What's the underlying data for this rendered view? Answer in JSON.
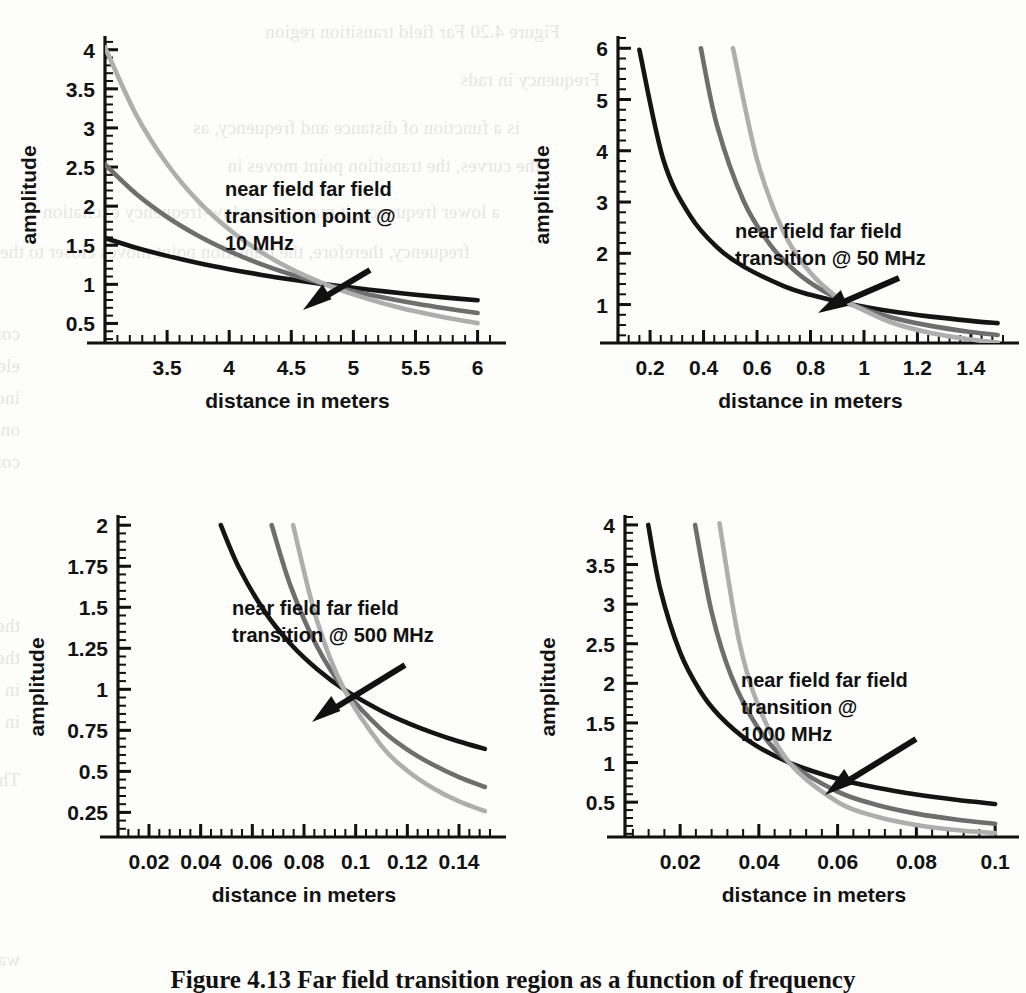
{
  "figure": {
    "caption": "Figure 4.13  Far field transition region as a function of frequency",
    "axis_labels": {
      "x": "distance in meters",
      "y": "amplitude"
    },
    "colors": {
      "curve_1_over_r": "#141414",
      "curve_1_over_r2": "#6e6e6e",
      "curve_1_over_r3": "#aeaeae",
      "axis": "#111111",
      "page_background": "#fdfdfb",
      "text": "#111111"
    }
  },
  "chart_data": [
    {
      "type": "line",
      "title": "near field far field transition point @ 10 MHz",
      "annotation": [
        "near field far field",
        "transition point @",
        "10 MHz"
      ],
      "frequency_mhz": 10,
      "xlabel": "distance in meters",
      "ylabel": "amplitude",
      "xlim": [
        3.0,
        6.1
      ],
      "ylim": [
        0.25,
        4.15
      ],
      "xticks": [
        3.5,
        4,
        4.5,
        5,
        5.5,
        6
      ],
      "xtick_labels": [
        "3.5",
        "4",
        "4.5",
        "5",
        "5.5",
        "6"
      ],
      "yticks": [
        0.5,
        1,
        1.5,
        2,
        2.5,
        3,
        3.5,
        4
      ],
      "ytick_labels": [
        "0.5",
        "1",
        "1.5",
        "2",
        "2.5",
        "3",
        "3.5",
        "4"
      ],
      "grid": false,
      "legend": "none",
      "transition_point": {
        "x": 4.775,
        "y": 1.0
      },
      "series": [
        {
          "name": "1/r",
          "color": "#141414",
          "x": [
            3.0,
            3.25,
            3.5,
            3.75,
            4.0,
            4.25,
            4.5,
            4.775,
            5.0,
            5.25,
            5.5,
            5.75,
            6.0
          ],
          "y": [
            1.592,
            1.469,
            1.364,
            1.273,
            1.194,
            1.124,
            1.061,
            1.0,
            0.955,
            0.91,
            0.868,
            0.83,
            0.796
          ]
        },
        {
          "name": "1/r^2",
          "color": "#6e6e6e",
          "x": [
            3.0,
            3.25,
            3.5,
            3.75,
            4.0,
            4.25,
            4.5,
            4.775,
            5.0,
            5.25,
            5.5,
            5.75,
            6.0
          ],
          "y": [
            2.533,
            2.158,
            1.861,
            1.621,
            1.425,
            1.262,
            1.126,
            1.0,
            0.912,
            0.828,
            0.754,
            0.69,
            0.633
          ]
        },
        {
          "name": "1/r^3",
          "color": "#aeaeae",
          "x": [
            3.0,
            3.25,
            3.5,
            3.75,
            4.0,
            4.25,
            4.5,
            4.775,
            5.0,
            5.25,
            5.5,
            5.75,
            6.0
          ],
          "y": [
            4.031,
            3.171,
            2.539,
            2.064,
            1.701,
            1.419,
            1.195,
            1.0,
            0.871,
            0.753,
            0.655,
            0.572,
            0.504
          ]
        }
      ]
    },
    {
      "type": "line",
      "title": "near field far field transition @ 50 MHz",
      "annotation": [
        "near field far field",
        "transition @ 50 MHz"
      ],
      "frequency_mhz": 50,
      "xlabel": "distance in meters",
      "ylabel": "amplitude",
      "xlim": [
        0.08,
        1.52
      ],
      "ylim": [
        0.25,
        6.2
      ],
      "xticks": [
        0.2,
        0.4,
        0.6,
        0.8,
        1.0,
        1.2,
        1.4
      ],
      "xtick_labels": [
        "0.2",
        "0.4",
        "0.6",
        "0.8",
        "1",
        "1.2",
        "1.4"
      ],
      "yticks": [
        1,
        2,
        3,
        4,
        5,
        6
      ],
      "ytick_labels": [
        "1",
        "2",
        "3",
        "4",
        "5",
        "6"
      ],
      "grid": false,
      "legend": "none",
      "transition_point": {
        "x": 0.955,
        "y": 1.0
      },
      "series": [
        {
          "name": "1/r",
          "color": "#141414",
          "x": [
            0.16,
            0.25,
            0.35,
            0.45,
            0.55,
            0.7,
            0.8,
            0.955,
            1.1,
            1.25,
            1.4,
            1.5
          ],
          "y": [
            5.97,
            3.82,
            2.73,
            2.12,
            1.74,
            1.36,
            1.19,
            1.0,
            0.868,
            0.764,
            0.682,
            0.637
          ]
        },
        {
          "name": "1/r^2",
          "color": "#6e6e6e",
          "x": [
            0.39,
            0.45,
            0.55,
            0.65,
            0.75,
            0.85,
            0.955,
            1.1,
            1.25,
            1.4,
            1.5
          ],
          "y": [
            6.0,
            4.5,
            3.02,
            2.16,
            1.62,
            1.26,
            1.0,
            0.754,
            0.584,
            0.465,
            0.405
          ]
        },
        {
          "name": "1/r^3",
          "color": "#aeaeae",
          "x": [
            0.51,
            0.6,
            0.7,
            0.8,
            0.9,
            0.955,
            1.1,
            1.25,
            1.4,
            1.5
          ],
          "y": [
            6.0,
            3.83,
            2.41,
            1.62,
            1.14,
            1.0,
            0.655,
            0.446,
            0.317,
            0.258
          ]
        }
      ]
    },
    {
      "type": "line",
      "title": "near field far field transition @ 500 MHz",
      "annotation": [
        "near field far field",
        "transition @ 500 MHz"
      ],
      "frequency_mhz": 500,
      "xlabel": "distance in meters",
      "ylabel": "amplitude",
      "xlim": [
        0.008,
        0.152
      ],
      "ylim": [
        0.1,
        2.05
      ],
      "xticks": [
        0.02,
        0.04,
        0.06,
        0.08,
        0.1,
        0.12,
        0.14
      ],
      "xtick_labels": [
        "0.02",
        "0.04",
        "0.06",
        "0.08",
        "0.1",
        "0.12",
        "0.14"
      ],
      "yticks": [
        0.25,
        0.5,
        0.75,
        1,
        1.25,
        1.5,
        1.75,
        2
      ],
      "ytick_labels": [
        "0.25",
        "0.5",
        "0.75",
        "1",
        "1.25",
        "1.5",
        "1.75",
        "2"
      ],
      "grid": false,
      "legend": "none",
      "transition_point": {
        "x": 0.0955,
        "y": 1.0
      },
      "series": [
        {
          "name": "1/r",
          "color": "#141414",
          "x": [
            0.0478,
            0.055,
            0.065,
            0.075,
            0.085,
            0.0955,
            0.11,
            0.12,
            0.13,
            0.14,
            0.15
          ],
          "y": [
            2.0,
            1.736,
            1.469,
            1.273,
            1.124,
            1.0,
            0.868,
            0.796,
            0.735,
            0.682,
            0.637
          ]
        },
        {
          "name": "1/r^2",
          "color": "#6e6e6e",
          "x": [
            0.0675,
            0.075,
            0.085,
            0.0955,
            0.11,
            0.12,
            0.13,
            0.14,
            0.15
          ],
          "y": [
            2.0,
            1.621,
            1.262,
            1.0,
            0.754,
            0.633,
            0.54,
            0.465,
            0.405
          ]
        },
        {
          "name": "1/r^3",
          "color": "#aeaeae",
          "x": [
            0.0758,
            0.085,
            0.0955,
            0.11,
            0.12,
            0.13,
            0.14,
            0.15
          ],
          "y": [
            2.0,
            1.419,
            1.0,
            0.655,
            0.504,
            0.397,
            0.317,
            0.258
          ]
        }
      ]
    },
    {
      "type": "line",
      "title": "near field far field transition @ 1000 MHz",
      "annotation": [
        "near field far field",
        "transition @",
        "1000 MHz"
      ],
      "frequency_mhz": 1000,
      "xlabel": "distance in meters",
      "ylabel": "amplitude",
      "xlim": [
        0.006,
        0.102
      ],
      "ylim": [
        0.06,
        4.1
      ],
      "xticks": [
        0.02,
        0.04,
        0.06,
        0.08,
        0.1
      ],
      "xtick_labels": [
        "0.02",
        "0.04",
        "0.06",
        "0.08",
        "0.1"
      ],
      "yticks": [
        0.5,
        1,
        1.5,
        2,
        2.5,
        3,
        3.5,
        4
      ],
      "ytick_labels": [
        "0.5",
        "1",
        "1.5",
        "2",
        "2.5",
        "3",
        "3.5",
        "4"
      ],
      "grid": false,
      "legend": "none",
      "transition_point": {
        "x": 0.0477,
        "y": 1.0
      },
      "series": [
        {
          "name": "1/r",
          "color": "#141414",
          "x": [
            0.0119,
            0.015,
            0.02,
            0.025,
            0.03,
            0.0375,
            0.0477,
            0.06,
            0.07,
            0.08,
            0.09,
            0.1
          ],
          "y": [
            4.0,
            3.18,
            2.39,
            1.91,
            1.59,
            1.27,
            1.0,
            0.795,
            0.681,
            0.596,
            0.53,
            0.477
          ]
        },
        {
          "name": "1/r^2",
          "color": "#6e6e6e",
          "x": [
            0.0238,
            0.028,
            0.033,
            0.04,
            0.0477,
            0.06,
            0.07,
            0.08,
            0.09,
            0.1
          ],
          "y": [
            4.0,
            2.9,
            2.09,
            1.42,
            1.0,
            0.632,
            0.464,
            0.355,
            0.281,
            0.228
          ]
        },
        {
          "name": "1/r^3",
          "color": "#aeaeae",
          "x": [
            0.03,
            0.035,
            0.04,
            0.0477,
            0.06,
            0.07,
            0.08,
            0.09,
            0.1
          ],
          "y": [
            4.02,
            2.53,
            1.7,
            1.0,
            0.502,
            0.316,
            0.212,
            0.149,
            0.109
          ]
        }
      ]
    }
  ],
  "bleed_text": {
    "lines": [
      "Figure 4.20 Far field transition region",
      "Frequency in rads",
      "is a function of distance and frequency, as",
      "the curves, the transition point moves in",
      "a lower frequency, it may cross a low-frequency excitation",
      "frequency, therefore, the transition point moves closer to the antenna",
      "concerned with the transition point will become clear as we develop expressions for the",
      "electric and magnetic fields. As before, we derive propagating wavefields in Chapters 7 and 8",
      "indicate that at frequencies of interest, ICs, packages, and other PCB features are",
      "on the order of mm, dipole antennas are quite efficient at these frequencies.",
      "compared with the wavelength in the equations of field distributions as",
      "the more important term is the first. This is often considered the transition zone from",
      "the reactive near field to the radiating far field. The dipole approximates in measurements",
      "in this regime. Figure 4.21 show some important aspects of radiation from antennas",
      "in air or a vacuum. This particular element has a frequency range of 0.5 GHz to 6 GHz.",
      "The near-field strengths are inverse square functions of near-field terms, but the",
      "wave front back is that it goes from frequency at a time, and each frequency takes time to"
    ]
  }
}
